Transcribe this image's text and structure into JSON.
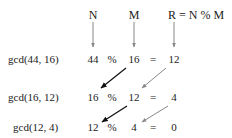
{
  "headers": {
    "n": "N",
    "m": "M",
    "r": "R = N % M"
  },
  "rows": [
    {
      "call": "gcd(44, 16)",
      "n": "44",
      "op": "%",
      "m": "16",
      "eq": "=",
      "r": "12"
    },
    {
      "call": "gcd(16, 12)",
      "n": "16",
      "op": "%",
      "m": "12",
      "eq": "=",
      "r": "4"
    },
    {
      "call": "gcd(12, 4)",
      "n": "12",
      "op": "%",
      "m": "4",
      "eq": "=",
      "r": "0"
    }
  ],
  "colors": {
    "text": "#222222",
    "header_arrow": "#888888",
    "m_to_n_arrow": "#111111",
    "r_to_m_arrow": "#888888"
  }
}
